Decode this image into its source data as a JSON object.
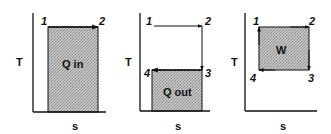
{
  "figure": {
    "axis_labels": {
      "y": "T",
      "x": "s"
    },
    "colors": {
      "line": "#111111",
      "fill": "#b5b5b5",
      "background": "#ffffff"
    },
    "panels": [
      {
        "id": "heat-in",
        "region_label": "Q in",
        "points": [
          {
            "label": "1"
          },
          {
            "label": "2"
          }
        ],
        "path": "1 → 2 (constant T, increasing s)"
      },
      {
        "id": "heat-out",
        "region_label": "Q out",
        "points": [
          {
            "label": "1"
          },
          {
            "label": "2"
          },
          {
            "label": "3"
          },
          {
            "label": "4"
          }
        ],
        "path": "1 → 2 → 3 → 4"
      },
      {
        "id": "net-work",
        "region_label": "W",
        "points": [
          {
            "label": "1"
          },
          {
            "label": "2"
          },
          {
            "label": "3"
          },
          {
            "label": "4"
          }
        ],
        "path": "1 → 2 → 3 → 4 → 1 (closed cycle)"
      }
    ]
  }
}
